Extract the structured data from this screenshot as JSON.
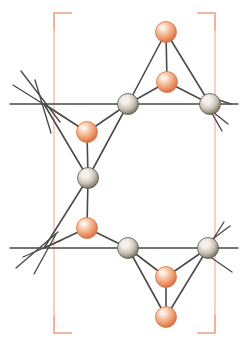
{
  "figure": {
    "title": "",
    "width": 246,
    "height": 348,
    "background_color": "#ffffff",
    "type": "crystal-structure-diagram"
  },
  "colors": {
    "bond": "#4a4a4a",
    "bond_light": "#6d6d6d",
    "atom_gray_base": "#8a8077",
    "atom_gray_highlight": "#f2efe9",
    "atom_gray_edge": "#5d554d",
    "atom_orange_base": "#e8855a",
    "atom_orange_highlight": "#fdf0e6",
    "atom_orange_edge": "#d9703f",
    "unit_cell_bracket": "#f0a080",
    "unit_cell_line": "#f2b49a",
    "background": "#ffffff"
  },
  "unit_cell": {
    "label": "unit-cell-brackets",
    "left_x": 54,
    "right_x": 215,
    "top_y": 13,
    "bottom_y": 333,
    "arm_length": 18,
    "stroke_width": 1.6
  },
  "lattice_lines": [
    {
      "name": "upper-horizontal-lattice-line",
      "x1": 10,
      "y1": 104,
      "x2": 238,
      "y2": 104
    },
    {
      "name": "lower-horizontal-lattice-line",
      "x1": 10,
      "y1": 248,
      "x2": 238,
      "y2": 248
    }
  ],
  "stub_bonds": [
    {
      "name": "stub-upper-left-a",
      "x1": 21,
      "y1": 71,
      "x2": 60,
      "y2": 122
    },
    {
      "name": "stub-upper-left-b",
      "x1": 13,
      "y1": 85,
      "x2": 64,
      "y2": 117
    },
    {
      "name": "stub-upper-left-c",
      "x1": 51,
      "y1": 133,
      "x2": 35,
      "y2": 80
    },
    {
      "name": "stub-upper-right-a",
      "x1": 206,
      "y1": 96,
      "x2": 231,
      "y2": 104
    },
    {
      "name": "stub-upper-right-b",
      "x1": 208,
      "y1": 108,
      "x2": 228,
      "y2": 124
    },
    {
      "name": "stub-upper-right-c",
      "x1": 210,
      "y1": 110,
      "x2": 222,
      "y2": 131
    },
    {
      "name": "stub-lower-left-a",
      "x1": 16,
      "y1": 268,
      "x2": 58,
      "y2": 232
    },
    {
      "name": "stub-lower-left-b",
      "x1": 34,
      "y1": 274,
      "x2": 56,
      "y2": 234
    },
    {
      "name": "stub-lower-left-c",
      "x1": 23,
      "y1": 257,
      "x2": 62,
      "y2": 240
    },
    {
      "name": "stub-lower-right-a",
      "x1": 203,
      "y1": 252,
      "x2": 232,
      "y2": 272
    },
    {
      "name": "stub-lower-right-b",
      "x1": 206,
      "y1": 244,
      "x2": 230,
      "y2": 226
    },
    {
      "name": "stub-lower-right-c",
      "x1": 210,
      "y1": 244,
      "x2": 224,
      "y2": 222
    }
  ],
  "bonds": [
    {
      "name": "bond-top-o1-o2",
      "from": "O-top",
      "to": "O-upper-mid"
    },
    {
      "name": "bond-top-o1-gray-tl",
      "from": "O-top",
      "to": "M-top-left"
    },
    {
      "name": "bond-top-o1-gray-tr",
      "from": "O-top",
      "to": "M-top-right"
    },
    {
      "name": "bond-o2-gray-tl",
      "from": "O-upper-mid",
      "to": "M-top-left"
    },
    {
      "name": "bond-o2-gray-tr",
      "from": "O-upper-mid",
      "to": "M-top-right"
    },
    {
      "name": "bond-oleft-up-gray-tl",
      "from": "O-left-upper",
      "to": "M-top-left"
    },
    {
      "name": "bond-oleft-up-center",
      "from": "O-left-upper",
      "to": "M-center"
    },
    {
      "name": "bond-oleft-up-cross-top",
      "from": "O-left-upper",
      "to": "X-top-left"
    },
    {
      "name": "bond-center-cross-top",
      "from": "M-center",
      "to": "X-top-left"
    },
    {
      "name": "bond-center-oleft-low",
      "from": "M-center",
      "to": "O-left-lower"
    },
    {
      "name": "bond-center-cross-bottom",
      "from": "M-center",
      "to": "X-bottom-left"
    },
    {
      "name": "bond-oleft-low-cross-bottom",
      "from": "O-left-lower",
      "to": "X-bottom-left"
    },
    {
      "name": "bond-oleft-low-gray-bl",
      "from": "O-left-lower",
      "to": "M-bottom-left"
    },
    {
      "name": "bond-gray-tl-to-center",
      "from": "M-top-left",
      "to": "M-center"
    },
    {
      "name": "bond-gray-bl-o3",
      "from": "M-bottom-left",
      "to": "O-lower-mid"
    },
    {
      "name": "bond-gray-bl-o4",
      "from": "M-bottom-left",
      "to": "O-bottom"
    },
    {
      "name": "bond-gray-br-o3",
      "from": "M-bottom-right",
      "to": "O-lower-mid"
    },
    {
      "name": "bond-gray-br-o4",
      "from": "M-bottom-right",
      "to": "O-bottom"
    },
    {
      "name": "bond-o3-o4",
      "from": "O-lower-mid",
      "to": "O-bottom"
    }
  ],
  "atoms": [
    {
      "name": "atom-oxygen-top",
      "id": "O-top",
      "element": "O",
      "type": "orange",
      "cx": 166,
      "cy": 32,
      "r": 10.5
    },
    {
      "name": "atom-oxygen-upper-mid",
      "id": "O-upper-mid",
      "element": "O",
      "type": "orange",
      "cx": 167,
      "cy": 82,
      "r": 10.5
    },
    {
      "name": "atom-metal-top-left",
      "id": "M-top-left",
      "element": "M",
      "type": "gray",
      "cx": 128,
      "cy": 104,
      "r": 10.5
    },
    {
      "name": "atom-metal-top-right",
      "id": "M-top-right",
      "element": "M",
      "type": "gray",
      "cx": 210,
      "cy": 104,
      "r": 10.5
    },
    {
      "name": "atom-oxygen-left-upper",
      "id": "O-left-upper",
      "element": "O",
      "type": "orange",
      "cx": 87,
      "cy": 132,
      "r": 10.5
    },
    {
      "name": "atom-metal-center",
      "id": "M-center",
      "element": "M",
      "type": "gray",
      "cx": 88,
      "cy": 178,
      "r": 10.5
    },
    {
      "name": "atom-oxygen-left-lower",
      "id": "O-left-lower",
      "element": "O",
      "type": "orange",
      "cx": 87,
      "cy": 228,
      "r": 10.5
    },
    {
      "name": "atom-metal-bottom-left",
      "id": "M-bottom-left",
      "element": "M",
      "type": "gray",
      "cx": 128,
      "cy": 248,
      "r": 10.5
    },
    {
      "name": "atom-metal-bottom-right",
      "id": "M-bottom-right",
      "element": "M",
      "type": "gray",
      "cx": 208,
      "cy": 248,
      "r": 10.5
    },
    {
      "name": "atom-oxygen-lower-mid",
      "id": "O-lower-mid",
      "element": "O",
      "type": "orange",
      "cx": 166,
      "cy": 277,
      "r": 10.5
    },
    {
      "name": "atom-oxygen-bottom",
      "id": "O-bottom",
      "element": "O",
      "type": "orange",
      "cx": 166,
      "cy": 317,
      "r": 10.5
    }
  ],
  "junctions": [
    {
      "name": "junction-top-left",
      "id": "X-top-left",
      "cx": 44,
      "cy": 104
    },
    {
      "name": "junction-bottom-left",
      "id": "X-bottom-left",
      "cx": 44,
      "cy": 248
    }
  ]
}
